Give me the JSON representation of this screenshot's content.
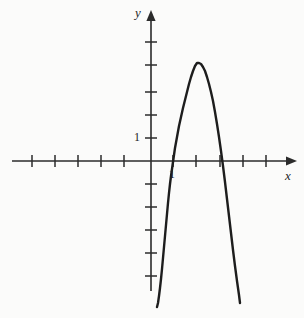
{
  "figure": {
    "background_color": "#fbfbfa",
    "ink_color": "#1d1d1d",
    "axis_color": "#2b2b2b"
  },
  "axes": {
    "x_axis_label": "x",
    "y_axis_label": "y",
    "x_tick_label": "1",
    "y_tick_label": "1",
    "origin_px": [
      151,
      161
    ],
    "unit_px": 23,
    "x_axis_y_px": 161,
    "y_axis_x_px": 151,
    "x_axis_start_px": 12,
    "x_axis_end_px": 297,
    "y_axis_top_px": 10,
    "y_axis_bottom_px": 291,
    "x_tick_positions_px": [
      32,
      55,
      78,
      101,
      124,
      173,
      196,
      220,
      243,
      266
    ],
    "y_tick_positions_px": [
      42,
      65,
      92,
      115,
      138,
      184,
      207,
      230,
      253,
      276
    ],
    "tick_half_length_px": 6
  },
  "chart_data": {
    "type": "line",
    "title": "",
    "xlabel": "x",
    "ylabel": "y",
    "grid": false,
    "legend": false,
    "xlim": [
      -6.0,
      6.5
    ],
    "ylim": [
      -6.5,
      6.6
    ],
    "x_ticks": [
      -5,
      -4,
      -3,
      -2,
      -1,
      1,
      2,
      3,
      4,
      5
    ],
    "y_ticks": [
      -5,
      -4,
      -3,
      -2,
      -1,
      1,
      2,
      3,
      4,
      5
    ],
    "x_tick_labels_shown": [
      "1"
    ],
    "y_tick_labels_shown": [
      "1"
    ],
    "annotations": [],
    "series": [
      {
        "name": "parabola",
        "shape": "downward-opening parabola",
        "vertex": [
          2.0,
          4.25
        ],
        "roots": [
          1.0,
          2.95
        ],
        "equation": "y = -4.25(x-2)^2 + 4.25",
        "x": [
          0.72,
          0.9,
          1.1,
          1.3,
          1.5,
          1.7,
          1.85,
          2.0,
          2.15,
          2.3,
          2.5,
          2.7,
          2.9,
          3.1,
          3.3,
          3.5,
          3.7,
          3.88
        ],
        "y": [
          -6.35,
          -1.95,
          0.85,
          2.65,
          3.65,
          4.15,
          4.25,
          4.25,
          4.2,
          3.95,
          3.2,
          1.9,
          0.1,
          -2.2,
          -4.0,
          -5.0,
          -5.9,
          -6.2
        ],
        "polyline_px": [
          [
            157,
            307
          ],
          [
            158,
            303
          ],
          [
            159,
            296
          ],
          [
            160,
            288
          ],
          [
            161,
            279
          ],
          [
            162,
            269
          ],
          [
            163,
            258
          ],
          [
            164,
            247
          ],
          [
            165,
            236
          ],
          [
            166,
            225
          ],
          [
            167,
            214
          ],
          [
            168,
            203
          ],
          [
            169,
            193
          ],
          [
            170,
            184
          ],
          [
            171,
            176
          ],
          [
            172,
            169
          ],
          [
            173,
            162
          ],
          [
            174,
            155
          ],
          [
            175,
            148
          ],
          [
            177,
            137
          ],
          [
            179,
            126
          ],
          [
            181,
            117
          ],
          [
            183,
            108
          ],
          [
            185,
            100
          ],
          [
            187,
            92
          ],
          [
            189,
            84
          ],
          [
            191,
            77
          ],
          [
            193,
            71
          ],
          [
            195,
            66
          ],
          [
            197,
            63
          ],
          [
            199,
            63
          ],
          [
            201,
            64
          ],
          [
            203,
            67
          ],
          [
            205,
            71
          ],
          [
            207,
            77
          ],
          [
            209,
            84
          ],
          [
            211,
            92
          ],
          [
            213,
            101
          ],
          [
            215,
            112
          ],
          [
            217,
            124
          ],
          [
            219,
            137
          ],
          [
            221,
            151
          ],
          [
            223,
            166
          ],
          [
            225,
            182
          ],
          [
            227,
            199
          ],
          [
            229,
            216
          ],
          [
            231,
            233
          ],
          [
            233,
            250
          ],
          [
            235,
            266
          ],
          [
            237,
            281
          ],
          [
            239,
            295
          ],
          [
            240,
            303
          ]
        ]
      }
    ]
  }
}
